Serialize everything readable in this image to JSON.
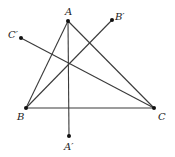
{
  "diagram": {
    "type": "geometry-triangle-lines",
    "stroke_color": "#3a3a3a",
    "point_color": "#111111",
    "points": {
      "A": {
        "label": "A",
        "x": 68,
        "y": 21
      },
      "B": {
        "label": "B",
        "x": 26,
        "y": 108
      },
      "C": {
        "label": "C",
        "x": 154,
        "y": 108
      },
      "A_prime": {
        "label": "A′",
        "x": 69,
        "y": 136
      },
      "B_prime": {
        "label": "B′",
        "x": 112,
        "y": 20
      },
      "C_prime": {
        "label": "C′",
        "x": 21,
        "y": 38
      }
    },
    "segments": [
      {
        "from": "A",
        "to": "B"
      },
      {
        "from": "B",
        "to": "C"
      },
      {
        "from": "C",
        "to": "A"
      },
      {
        "from": "A",
        "to": "A_prime"
      },
      {
        "from": "B",
        "to": "B_prime"
      },
      {
        "from": "C",
        "to": "C_prime"
      }
    ]
  }
}
